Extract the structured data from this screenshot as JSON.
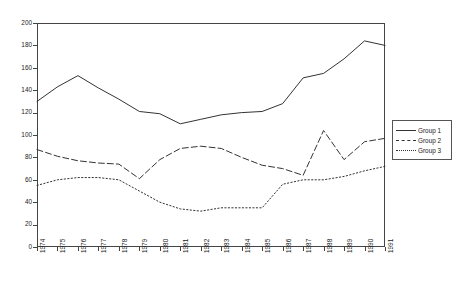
{
  "chart_data": {
    "type": "line",
    "title": "",
    "xlabel": "",
    "ylabel": "",
    "ylim": [
      0,
      200
    ],
    "ytick_step": 20,
    "yticks": [
      0,
      20,
      40,
      60,
      80,
      100,
      120,
      140,
      160,
      180,
      200
    ],
    "grid": false,
    "legend_position": "right",
    "categories": [
      "1974",
      "1975",
      "1976",
      "1977",
      "1978",
      "1979",
      "1980",
      "1981",
      "1982",
      "1983",
      "1984",
      "1985",
      "1986",
      "1987",
      "1988",
      "1989",
      "1990",
      "1991"
    ],
    "series": [
      {
        "name": "Group 1",
        "style": "solid",
        "color": "#333333",
        "values": [
          130,
          143,
          153,
          142,
          132,
          121,
          119,
          110,
          114,
          118,
          120,
          121,
          128,
          151,
          155,
          168,
          184,
          180
        ]
      },
      {
        "name": "Group 2",
        "style": "dashed",
        "color": "#333333",
        "values": [
          87,
          81,
          77,
          75,
          74,
          61,
          78,
          88,
          90,
          88,
          80,
          73,
          70,
          64,
          104,
          78,
          94,
          97
        ]
      },
      {
        "name": "Group 3",
        "style": "dotted",
        "color": "#333333",
        "values": [
          55,
          60,
          62,
          62,
          60,
          50,
          40,
          34,
          32,
          35,
          35,
          35,
          56,
          60,
          60,
          63,
          68,
          72
        ]
      }
    ]
  },
  "legend": {
    "items": [
      {
        "label": "Group 1",
        "style": "solid"
      },
      {
        "label": "Group 2",
        "style": "dashed"
      },
      {
        "label": "Group 3",
        "style": "dotted"
      }
    ]
  }
}
